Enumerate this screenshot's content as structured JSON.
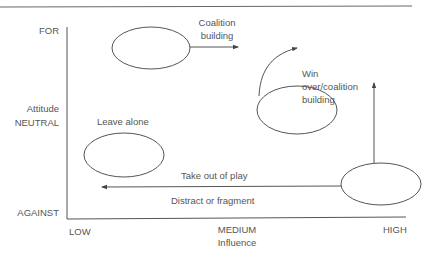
{
  "axes": {
    "y_label": "Attitude",
    "y_ticks": [
      "FOR",
      "NEUTRAL",
      "AGAINST"
    ],
    "x_label": "Influence",
    "x_ticks": [
      "LOW",
      "MEDIUM",
      "HIGH"
    ]
  },
  "annotations": {
    "coalition_building": [
      "Coalition",
      "building"
    ],
    "win_over": [
      "Win",
      "over/coalition",
      "building"
    ],
    "leave_alone": "Leave alone",
    "take_out_of_play": "Take out of play",
    "distract_or_fragment": "Distract or fragment"
  },
  "colors": {
    "line": "#555555",
    "text": "#555555"
  }
}
